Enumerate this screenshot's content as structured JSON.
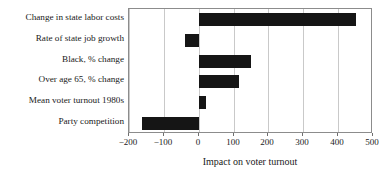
{
  "chart_data": {
    "type": "bar",
    "orientation": "horizontal",
    "title": "",
    "subtitle": "",
    "xlabel": "Impact on voter turnout",
    "ylabel": "",
    "categories": [
      "Change in state labor costs",
      "Rate of state job growth",
      "Black, % change",
      "Over age 65, % change",
      "Mean voter turnout 1980s",
      "Party competition"
    ],
    "values": [
      452,
      -40,
      150,
      117,
      22,
      -163
    ],
    "series": [
      {
        "name": "Impact on voter turnout",
        "values": [
          452,
          -40,
          150,
          117,
          22,
          -163
        ]
      }
    ],
    "xlim": [
      -200,
      500
    ],
    "xticks": [
      -200,
      -100,
      0,
      100,
      200,
      300,
      400,
      500
    ],
    "xtick_labels": [
      "−200",
      "−100",
      "0",
      "100",
      "200",
      "300",
      "400",
      "500"
    ],
    "grid": true,
    "grid_axis": "x",
    "legend": false,
    "legend_position": "none",
    "bar_color": "#151515",
    "grid_color": "#c9c9c9",
    "frame_color": "#8c8c8c",
    "background_color": "#ffffff"
  }
}
